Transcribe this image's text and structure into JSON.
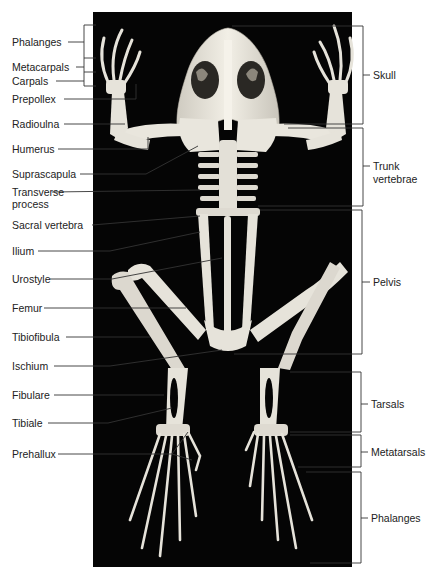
{
  "figure": {
    "background_color": "#050505",
    "bone_color": "#e6e3da",
    "line_color": "#333333"
  },
  "labels_left": [
    {
      "id": "phalanges-hand",
      "text": "Phalanges",
      "x": 12,
      "y": 36
    },
    {
      "id": "metacarpals",
      "text": "Metacarpals",
      "x": 12,
      "y": 61
    },
    {
      "id": "carpals",
      "text": "Carpals",
      "x": 12,
      "y": 76
    },
    {
      "id": "prepollex",
      "text": "Prepollex",
      "x": 12,
      "y": 93
    },
    {
      "id": "radioulna",
      "text": "Radioulna",
      "x": 12,
      "y": 118
    },
    {
      "id": "humerus",
      "text": "Humerus",
      "x": 12,
      "y": 143
    },
    {
      "id": "suprascapula",
      "text": "Suprascapula",
      "x": 12,
      "y": 168
    },
    {
      "id": "transverse-process-1",
      "text": "Transverse",
      "x": 12,
      "y": 186
    },
    {
      "id": "transverse-process-2",
      "text": "process",
      "x": 12,
      "y": 198
    },
    {
      "id": "sacral-vertebra",
      "text": "Sacral vertebra",
      "x": 12,
      "y": 220
    },
    {
      "id": "ilium",
      "text": "Ilium",
      "x": 12,
      "y": 246
    },
    {
      "id": "urostyle",
      "text": "Urostyle",
      "x": 12,
      "y": 273
    },
    {
      "id": "femur",
      "text": "Femur",
      "x": 12,
      "y": 302
    },
    {
      "id": "tibiofibula",
      "text": "Tibiofibula",
      "x": 12,
      "y": 331
    },
    {
      "id": "ischium",
      "text": "Ischium",
      "x": 12,
      "y": 360
    },
    {
      "id": "fibulare",
      "text": "Fibulare",
      "x": 12,
      "y": 390
    },
    {
      "id": "tibiale",
      "text": "Tibiale",
      "x": 12,
      "y": 417
    },
    {
      "id": "prehallux",
      "text": "Prehallux",
      "x": 12,
      "y": 448
    }
  ],
  "labels_right": [
    {
      "id": "skull",
      "text": "Skull",
      "x": 375,
      "y": 69
    },
    {
      "id": "trunk-vertebrae-1",
      "text": "Trunk",
      "x": 374,
      "y": 160
    },
    {
      "id": "trunk-vertebrae-2",
      "text": "vertebrae",
      "x": 374,
      "y": 173
    },
    {
      "id": "pelvis",
      "text": "Pelvis",
      "x": 373,
      "y": 276
    },
    {
      "id": "tarsals",
      "text": "Tarsals",
      "x": 372,
      "y": 398
    },
    {
      "id": "metatarsals",
      "text": "Metatarsals",
      "x": 372,
      "y": 446
    },
    {
      "id": "phalanges-foot",
      "text": "Phalanges",
      "x": 372,
      "y": 513
    }
  ]
}
